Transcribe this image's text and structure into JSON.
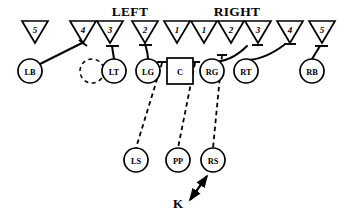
{
  "diagram": {
    "title_left": "LEFT",
    "title_right": "RIGHT",
    "background_color": "#ffffff",
    "stroke_color": "#000000"
  },
  "headers": [
    {
      "label": "LEFT",
      "x": 130,
      "y": 16
    },
    {
      "label": "RIGHT",
      "x": 237,
      "y": 16
    }
  ],
  "defenders": [
    {
      "name": "defender-5-left",
      "number": "5",
      "cx": 35,
      "cy": 32,
      "w": 27,
      "h": 22
    },
    {
      "name": "defender-4-left",
      "number": "4",
      "cx": 83,
      "cy": 32,
      "w": 27,
      "h": 22
    },
    {
      "name": "defender-3-left",
      "number": "3",
      "cx": 110,
      "cy": 32,
      "w": 27,
      "h": 22
    },
    {
      "name": "defender-2-left",
      "number": "2",
      "cx": 145,
      "cy": 32,
      "w": 27,
      "h": 22
    },
    {
      "name": "defender-1-left",
      "number": "1",
      "cx": 177,
      "cy": 32,
      "w": 27,
      "h": 22
    },
    {
      "name": "defender-1-right",
      "number": "1",
      "cx": 204,
      "cy": 32,
      "w": 27,
      "h": 22
    },
    {
      "name": "defender-2-right",
      "number": "2",
      "cx": 231,
      "cy": 32,
      "w": 27,
      "h": 22
    },
    {
      "name": "defender-3-right",
      "number": "3",
      "cx": 258,
      "cy": 32,
      "w": 27,
      "h": 22
    },
    {
      "name": "defender-4-right",
      "number": "4",
      "cx": 290,
      "cy": 32,
      "w": 27,
      "h": 22
    },
    {
      "name": "defender-5-right",
      "number": "5",
      "cx": 322,
      "cy": 32,
      "w": 27,
      "h": 22
    }
  ],
  "blockers": [
    {
      "name": "player-lb",
      "label": "LB",
      "cx": 30,
      "cy": 71,
      "r": 12,
      "shape": "circle"
    },
    {
      "name": "player-vacant",
      "label": "",
      "cx": 92,
      "cy": 71,
      "r": 12,
      "shape": "circle-dashed"
    },
    {
      "name": "player-lt",
      "label": "LT",
      "cx": 114,
      "cy": 71,
      "r": 12,
      "shape": "circle"
    },
    {
      "name": "player-lg",
      "label": "LG",
      "cx": 148,
      "cy": 71,
      "r": 12,
      "shape": "circle"
    },
    {
      "name": "player-c",
      "label": "C",
      "cx": 180,
      "cy": 71,
      "r": 12,
      "shape": "square"
    },
    {
      "name": "player-rg",
      "label": "RG",
      "cx": 212,
      "cy": 71,
      "r": 12,
      "shape": "circle"
    },
    {
      "name": "player-rt",
      "label": "RT",
      "cx": 246,
      "cy": 71,
      "r": 12,
      "shape": "circle"
    },
    {
      "name": "player-rb",
      "label": "RB",
      "cx": 312,
      "cy": 71,
      "r": 12,
      "shape": "circle"
    }
  ],
  "backs": [
    {
      "name": "player-ls",
      "label": "LS",
      "cx": 136,
      "cy": 160,
      "r": 12
    },
    {
      "name": "player-pp",
      "label": "PP",
      "cx": 178,
      "cy": 160,
      "r": 12
    },
    {
      "name": "player-rs",
      "label": "RS",
      "cx": 213,
      "cy": 160,
      "r": 12
    }
  ],
  "kicker": {
    "name": "kicker-k",
    "label": "K",
    "x": 178,
    "y": 208
  },
  "assignments": [
    {
      "name": "assign-lb-to-4",
      "from": "LB",
      "to": "4-left",
      "style": "solid"
    },
    {
      "name": "assign-lt-to-3",
      "from": "LT",
      "to": "3-left",
      "style": "solid"
    },
    {
      "name": "assign-lg-to-2",
      "from": "LG",
      "to": "2-left",
      "style": "solid"
    },
    {
      "name": "assign-rg-to-3",
      "from": "RG",
      "to": "3-right",
      "style": "solid"
    },
    {
      "name": "assign-rt-to-4",
      "from": "RT",
      "to": "4-right",
      "style": "solid"
    },
    {
      "name": "assign-rb-to-5",
      "from": "RB",
      "to": "5-right",
      "style": "solid"
    },
    {
      "name": "assign-lg-to-ls",
      "from": "LG",
      "to": "LS",
      "style": "dashed"
    },
    {
      "name": "assign-c-to-pp",
      "from": "C",
      "to": "PP",
      "style": "dashed"
    },
    {
      "name": "assign-rg-to-rs",
      "from": "RG",
      "to": "RS",
      "style": "dashed"
    },
    {
      "name": "assign-k-to-rs",
      "from": "K",
      "to": "RS",
      "style": "arrow"
    }
  ]
}
